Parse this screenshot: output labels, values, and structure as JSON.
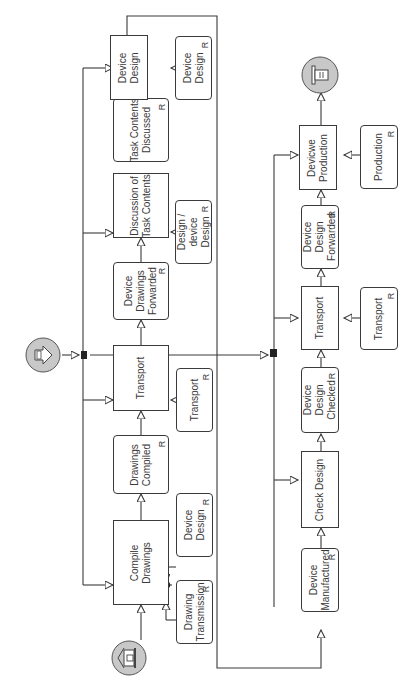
{
  "diagram": {
    "orientation": "rotated-90-ccw",
    "colors": {
      "stroke": "#3a3a3a",
      "event_fill": "#c8c8c8",
      "background": "#ffffff"
    },
    "lane_top": {
      "steps": [
        {
          "id": "compile_drawings",
          "label": "Compile Drawings",
          "lines": [
            "Compile",
            "Drawings"
          ],
          "type": "process"
        },
        {
          "id": "drawings_compiled",
          "label": "Drawings Compiled",
          "lines": [
            "Drawings",
            "Compiled"
          ],
          "type": "result",
          "marker": "R"
        },
        {
          "id": "transport_1",
          "label": "Transport",
          "lines": [
            "Transport"
          ],
          "type": "process"
        },
        {
          "id": "device_drawings_forwarded",
          "label": "Device Drawings Forwarded",
          "lines": [
            "Device",
            "Drawings",
            "Forwarded"
          ],
          "type": "result",
          "marker": "R"
        },
        {
          "id": "discussion_task_contents",
          "label": "Discussion of Task Contents",
          "lines": [
            "Discussion of",
            "Task Contents"
          ],
          "type": "process"
        },
        {
          "id": "task_contents_discussed",
          "label": "Task Contents Discussed",
          "lines": [
            "Task Contents",
            "Discussed"
          ],
          "type": "result",
          "marker": "R"
        },
        {
          "id": "device_design_1",
          "label": "Device Design",
          "lines": [
            "Device",
            "Design"
          ],
          "type": "process"
        }
      ],
      "resources": [
        {
          "id": "res_device_design_a",
          "label": "Device Design",
          "lines": [
            "Device",
            "Design"
          ],
          "marker": "R"
        },
        {
          "id": "res_drawing_transmission",
          "label": "Drawing Transmission",
          "lines": [
            "Drawing",
            "Transmission"
          ],
          "marker": "R"
        },
        {
          "id": "res_transport_1",
          "label": "Transport",
          "lines": [
            "Transport"
          ],
          "marker": "R"
        },
        {
          "id": "res_design_device_design",
          "label": "Design / device Design",
          "lines": [
            "Design /",
            "device",
            "Design"
          ],
          "marker": "R"
        },
        {
          "id": "res_device_design_b",
          "label": "Device Design",
          "lines": [
            "Device",
            "Design"
          ],
          "marker": "R"
        }
      ]
    },
    "lane_bottom": {
      "steps": [
        {
          "id": "device_manufactured",
          "label": "Device Manufactured",
          "lines": [
            "Device",
            "Manufactured"
          ],
          "type": "result",
          "marker": "R"
        },
        {
          "id": "check_design",
          "label": "Check Design",
          "lines": [
            "Check Design"
          ],
          "type": "process"
        },
        {
          "id": "device_design_checked",
          "label": "Device Design Checked",
          "lines": [
            "Device",
            "Design",
            "Checked"
          ],
          "type": "result",
          "marker": "R"
        },
        {
          "id": "transport_2",
          "label": "Transport",
          "lines": [
            "Transport"
          ],
          "type": "process"
        },
        {
          "id": "device_design_forwarded",
          "label": "Device Design Forwarded",
          "lines": [
            "Device",
            "Design",
            "Forwarded"
          ],
          "type": "result",
          "marker": "R"
        },
        {
          "id": "devicwe_production",
          "label": "Devicwe Production",
          "lines": [
            "Devicwe",
            "Production"
          ],
          "type": "process"
        }
      ],
      "resources": [
        {
          "id": "res_transport_2",
          "label": "Transport",
          "lines": [
            "Transport"
          ],
          "marker": "R"
        },
        {
          "id": "res_production",
          "label": "Production",
          "lines": [
            "Production"
          ],
          "marker": "R"
        }
      ]
    },
    "events": [
      {
        "id": "start_event",
        "icon": "building-icon"
      },
      {
        "id": "intermediate_event",
        "icon": "arrow-right-icon"
      },
      {
        "id": "end_event",
        "icon": "stop-tower-icon"
      }
    ],
    "markers": {
      "resource": "R"
    }
  }
}
